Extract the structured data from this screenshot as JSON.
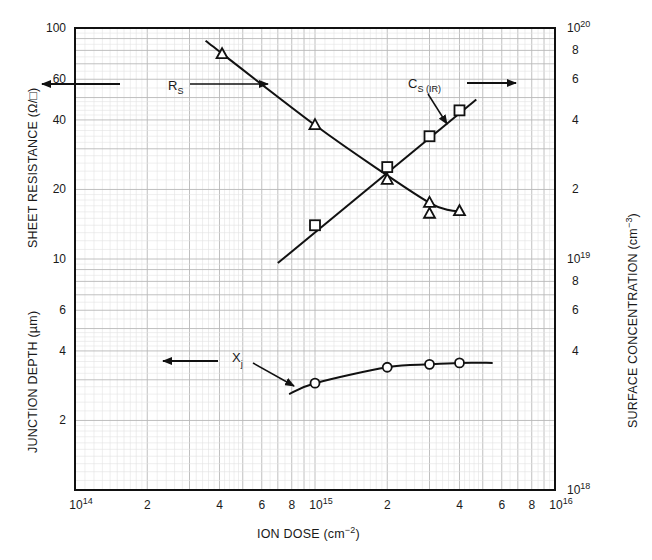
{
  "chart_data": {
    "type": "line",
    "title": "",
    "xlabel": "ION DOSE (cm",
    "xlabel_sup": "−2",
    "xlabel_close": ")",
    "xscale": "log",
    "xlim": [
      100000000000000.0,
      1e+16
    ],
    "x_ticks": [
      {
        "value": 100000000000000.0,
        "label": "10",
        "sup": "14"
      },
      {
        "value": 200000000000000.0,
        "label": "2"
      },
      {
        "value": 400000000000000.0,
        "label": "4"
      },
      {
        "value": 600000000000000.0,
        "label": "6"
      },
      {
        "value": 800000000000000.0,
        "label": "8"
      },
      {
        "value": 1000000000000000.0,
        "label": "10",
        "sup": "15"
      },
      {
        "value": 2000000000000000.0,
        "label": "2"
      },
      {
        "value": 4000000000000000.0,
        "label": "4"
      },
      {
        "value": 6000000000000000.0,
        "label": "6"
      },
      {
        "value": 8000000000000000.0,
        "label": "8"
      },
      {
        "value": 1e+16,
        "label": "10",
        "sup": "16"
      }
    ],
    "left_axis_upper": {
      "label": "SHEET RESISTANCE (Ω/□)",
      "scale": "log",
      "ylim": [
        10,
        100
      ],
      "ticks": [
        {
          "value": 100,
          "label": "100"
        },
        {
          "value": 60,
          "label": "60"
        },
        {
          "value": 40,
          "label": "40"
        },
        {
          "value": 20,
          "label": "20"
        },
        {
          "value": 10,
          "label": "10"
        }
      ]
    },
    "left_axis_lower": {
      "label": "JUNCTION DEPTH (µm)",
      "scale": "log",
      "ylim": [
        1,
        10
      ],
      "ticks": [
        {
          "value": 6,
          "label": "6"
        },
        {
          "value": 4,
          "label": "4"
        },
        {
          "value": 2,
          "label": "2"
        }
      ]
    },
    "right_axis": {
      "label": "SURFACE CONCENTRATION (cm",
      "label_sup": "−3",
      "label_close": ")",
      "scale": "log",
      "ylim": [
        1e+18,
        1e+20
      ],
      "ticks": [
        {
          "value": 1e+20,
          "label": "10",
          "sup": "20"
        },
        {
          "value": 8e+19,
          "label": "8"
        },
        {
          "value": 6e+19,
          "label": "6"
        },
        {
          "value": 4e+19,
          "label": "4"
        },
        {
          "value": 2e+19,
          "label": "2"
        },
        {
          "value": 1e+19,
          "label": "10",
          "sup": "19"
        },
        {
          "value": 8e+18,
          "label": "8"
        },
        {
          "value": 6e+18,
          "label": "6"
        },
        {
          "value": 4e+18,
          "label": "4"
        },
        {
          "value": 1e+18,
          "label": "10",
          "sup": "18"
        }
      ]
    },
    "grid": true,
    "series": [
      {
        "name": "R",
        "name_sub": "S",
        "axis": "left_upper",
        "marker": "triangle",
        "x": [
          410000000000000.0,
          1000000000000000.0,
          2000000000000000.0,
          3000000000000000.0,
          3000000000000000.0,
          4000000000000000.0
        ],
        "y": [
          77,
          38,
          22,
          17.5,
          15.7,
          16.1
        ],
        "curve_x": [
          350000000000000.0,
          1000000000000000.0,
          2000000000000000.0,
          3000000000000000.0,
          3600000000000000.0,
          4000000000000000.0
        ],
        "curve_y": [
          88,
          38,
          23,
          17.5,
          16.3,
          16.1
        ]
      },
      {
        "name": "C",
        "name_sub": "S (IR)",
        "axis": "right",
        "marker": "square",
        "x": [
          1000000000000000.0,
          2000000000000000.0,
          3000000000000000.0,
          4000000000000000.0
        ],
        "y": [
          1.4e+19,
          2.5e+19,
          3.4e+19,
          4.4e+19
        ],
        "curve_x": [
          700000000000000.0,
          4700000000000000.0
        ],
        "curve_y": [
          9.6e+18,
          4.9e+19
        ]
      },
      {
        "name": "X",
        "name_sub": "j",
        "axis": "left_lower",
        "marker": "circle",
        "x": [
          1000000000000000.0,
          2000000000000000.0,
          3000000000000000.0,
          4000000000000000.0
        ],
        "y": [
          2.9,
          3.4,
          3.5,
          3.55
        ],
        "curve_x": [
          780000000000000.0,
          1000000000000000.0,
          2000000000000000.0,
          3000000000000000.0,
          4000000000000000.0,
          5500000000000000.0
        ],
        "curve_y": [
          2.6,
          2.9,
          3.4,
          3.5,
          3.55,
          3.55
        ]
      }
    ],
    "annotations": [
      {
        "text": "R",
        "sub": "S",
        "points_to": "left axis (sheet resistance)"
      },
      {
        "text": "C",
        "sub": "S (IR)",
        "points_to": "right axis (surface concentration)"
      },
      {
        "text": "X",
        "sub": "j",
        "points_to": "left axis (junction depth)"
      }
    ]
  },
  "labels": {
    "left_upper_title": "SHEET RESISTANCE (Ω/□)",
    "left_lower_title": "JUNCTION DEPTH (µm)",
    "right_title_main": "SURFACE CONCENTRATION (cm",
    "right_title_sup": "−3",
    "right_title_close": ")",
    "x_title_main": "ION DOSE (cm",
    "x_title_sup": "−2",
    "x_title_close": ")",
    "rs_main": "R",
    "rs_sub": "S",
    "cs_main": "C",
    "cs_sub": "S (IR)",
    "xj_main": "X",
    "xj_sub": "j"
  }
}
